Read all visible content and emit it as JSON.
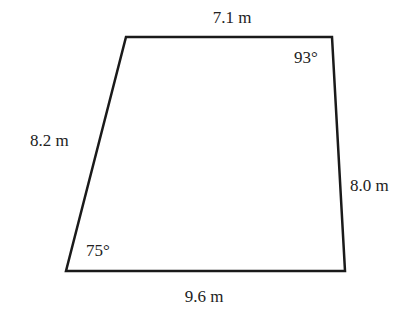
{
  "figure": {
    "type": "quadrilateral",
    "vertices": {
      "top_left": [
        126,
        37
      ],
      "top_right": [
        332,
        37
      ],
      "bottom_right": [
        345,
        271
      ],
      "bottom_left": [
        66,
        271
      ]
    },
    "stroke_color": "#1a1a1a",
    "sides": {
      "top": "7.1 m",
      "left": "8.2 m",
      "right": "8.0 m",
      "bottom": "9.6 m"
    },
    "angles": {
      "top_right": "93°",
      "bottom_left": "75°"
    }
  }
}
